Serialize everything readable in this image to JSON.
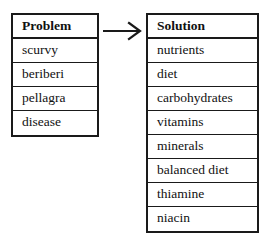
{
  "diagram": {
    "type": "problem-solution-mapping",
    "background_color": "#ffffff",
    "border_color": "#1a1a1a",
    "text_color": "#111111",
    "problem_table": {
      "header": "Problem",
      "items": [
        "scurvy",
        "beriberi",
        "pellagra",
        "disease"
      ]
    },
    "solution_table": {
      "header": "Solution",
      "items": [
        "nutrients",
        "diet",
        "carbohydrates",
        "vitamins",
        "minerals",
        "balanced diet",
        "thiamine",
        "niacin"
      ]
    },
    "connector": {
      "icon": "arrow-right-icon",
      "direction": "left-to-right",
      "from": "Problem",
      "to": "Solution"
    }
  }
}
